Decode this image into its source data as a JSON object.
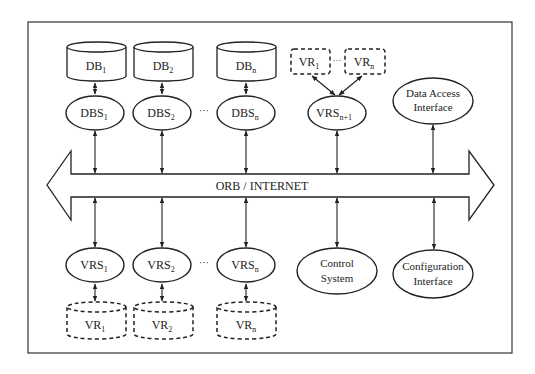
{
  "diagram": {
    "frame": true,
    "bus": {
      "label": "ORB / INTERNET"
    },
    "top_row": {
      "databases": [
        {
          "base": "DB",
          "sub": "1"
        },
        {
          "base": "DB",
          "sub": "2"
        },
        {
          "base": "DB",
          "sub": "n"
        }
      ],
      "db_servers": [
        {
          "base": "DBS",
          "sub": "1"
        },
        {
          "base": "DBS",
          "sub": "2"
        },
        {
          "base": "DBS",
          "sub": "n"
        }
      ],
      "ellipsis": "···",
      "virtual_repos": [
        {
          "base": "VR",
          "sub": "1"
        },
        {
          "base": "VR",
          "sub": "n"
        }
      ],
      "vr_ellipsis": "···",
      "vr_server": {
        "base": "VRS",
        "sub": "n+1"
      },
      "data_access": {
        "line1": "Data Access",
        "line2": "Interface"
      }
    },
    "bottom_row": {
      "vr_servers": [
        {
          "base": "VRS",
          "sub": "1"
        },
        {
          "base": "VRS",
          "sub": "2"
        },
        {
          "base": "VRS",
          "sub": "n"
        }
      ],
      "ellipsis": "···",
      "virtual_repos": [
        {
          "base": "VR",
          "sub": "1"
        },
        {
          "base": "VR",
          "sub": "2"
        },
        {
          "base": "VR",
          "sub": "n"
        }
      ],
      "control_system": {
        "line1": "Control",
        "line2": "System"
      },
      "configuration": {
        "line1": "Configuration",
        "line2": "Interface"
      }
    },
    "colors": {
      "stroke": "#222222",
      "background": "#ffffff"
    }
  }
}
